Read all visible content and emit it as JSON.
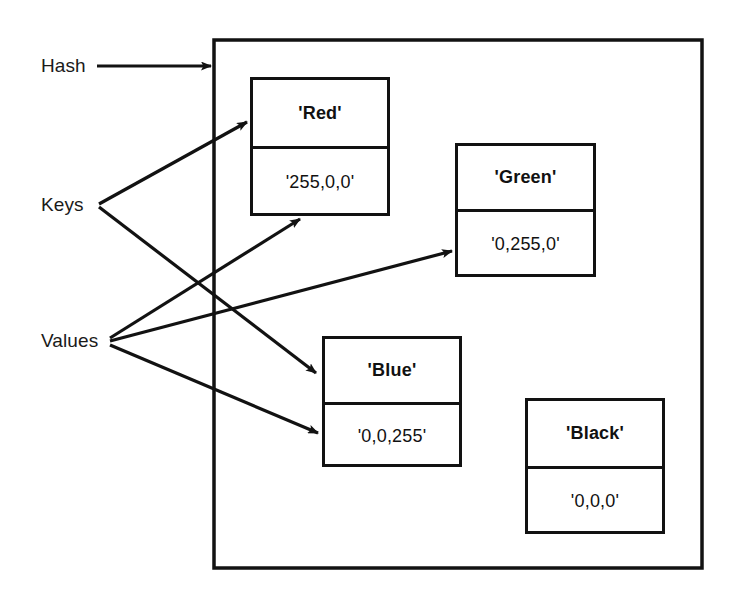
{
  "figure": {
    "outer_container_label": "hash-container",
    "stroke_color": "#121212",
    "text_color": "#111111"
  },
  "labels": {
    "hash": "Hash",
    "keys": "Keys",
    "values": "Values"
  },
  "entries": [
    {
      "id": "red",
      "key": "'Red'",
      "value": "'255,0,0'",
      "x": 250,
      "y": 77,
      "width": 140,
      "height": 139,
      "key_height": 69
    },
    {
      "id": "green",
      "key": "'Green'",
      "value": "'0,255,0'",
      "x": 455,
      "y": 143,
      "width": 141,
      "height": 134,
      "key_height": 66
    },
    {
      "id": "blue",
      "key": "'Blue'",
      "value": "'0,0,255'",
      "x": 322,
      "y": 336,
      "width": 140,
      "height": 131,
      "key_height": 66
    },
    {
      "id": "black",
      "key": "'Black'",
      "value": "'0,0,0'",
      "x": 525,
      "y": 398,
      "width": 140,
      "height": 136,
      "key_height": 68
    }
  ],
  "container": {
    "x": 214,
    "y": 40,
    "width": 488,
    "height": 528
  },
  "connectors": [
    {
      "id": "hash-to-container",
      "from": "Hash",
      "to": "hash-container",
      "x1": 97,
      "y1": 66,
      "x2": 211,
      "y2": 66
    },
    {
      "id": "keys-to-red",
      "from": "Keys",
      "to": "'Red' key cell",
      "x1": 99,
      "y1": 204,
      "x2": 247,
      "y2": 122
    },
    {
      "id": "keys-to-blue",
      "from": "Keys",
      "to": "'Blue' key cell",
      "x1": 99,
      "y1": 207,
      "x2": 316,
      "y2": 373
    },
    {
      "id": "values-to-red",
      "from": "Values",
      "to": "'255,0,0' value cell",
      "x1": 110,
      "y1": 338,
      "x2": 300,
      "y2": 219
    },
    {
      "id": "values-to-green",
      "from": "Values",
      "to": "'0,255,0' value cell",
      "x1": 110,
      "y1": 341,
      "x2": 452,
      "y2": 251
    },
    {
      "id": "values-to-blue",
      "from": "Values",
      "to": "'0,0,255' value cell",
      "x1": 110,
      "y1": 345,
      "x2": 318,
      "y2": 433
    }
  ],
  "label_positions": {
    "hash": {
      "x": 41,
      "y": 55
    },
    "keys": {
      "x": 41,
      "y": 194
    },
    "values": {
      "x": 41,
      "y": 330
    }
  }
}
